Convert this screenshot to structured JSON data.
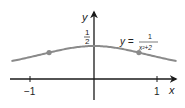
{
  "chart_data": {
    "type": "line",
    "title": "",
    "function_label": {
      "lhs": "y =",
      "numerator": "1",
      "denominator": "x²+2"
    },
    "xlabel": "x",
    "ylabel": "y",
    "x_ticks": [
      {
        "value": -1,
        "label": "−1"
      },
      {
        "value": 1,
        "label": "1"
      }
    ],
    "y_ticks": [
      {
        "value": 0.5,
        "label_num": "1",
        "label_den": "2"
      }
    ],
    "xlim": [
      -1.5,
      1.6
    ],
    "ylim": [
      -0.3,
      0.9
    ],
    "series": [
      {
        "name": "y = 1/(x²+2)",
        "x": [
          -1.5,
          -1.25,
          -1.0,
          -0.75,
          -0.5,
          -0.25,
          0.0,
          0.25,
          0.5,
          0.75,
          1.0,
          1.25,
          1.5
        ],
        "values": [
          0.235,
          0.281,
          0.333,
          0.39,
          0.444,
          0.485,
          0.5,
          0.485,
          0.444,
          0.39,
          0.333,
          0.281,
          0.235
        ]
      }
    ],
    "marked_points": [
      {
        "x": -0.707,
        "y": 0.4
      },
      {
        "x": 0.707,
        "y": 0.4
      }
    ],
    "grid": false,
    "curve_color": "#8a8a8a",
    "axis_color": "#1a1a1a"
  }
}
